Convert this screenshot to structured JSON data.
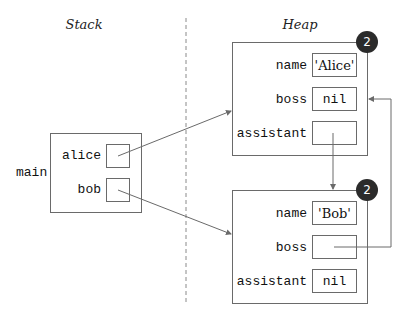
{
  "labels": {
    "stack": "Stack",
    "heap": "Heap"
  },
  "stack": {
    "frame_name": "main",
    "variables": [
      {
        "name": "alice",
        "points_to": "heap.objects.0"
      },
      {
        "name": "bob",
        "points_to": "heap.objects.1"
      }
    ]
  },
  "heap": {
    "objects": [
      {
        "refcount": "2",
        "fields": [
          {
            "name": "name",
            "value": "'Alice'"
          },
          {
            "name": "boss",
            "value": "nil"
          },
          {
            "name": "assistant",
            "value": "",
            "points_to": "heap.objects.1"
          }
        ]
      },
      {
        "refcount": "2",
        "fields": [
          {
            "name": "name",
            "value": "'Bob'"
          },
          {
            "name": "boss",
            "value": "",
            "points_to": "heap.objects.0"
          },
          {
            "name": "assistant",
            "value": "nil"
          }
        ]
      }
    ]
  },
  "colors": {
    "line": "#6a6a6a",
    "badge": "#2b2b2b",
    "divider": "#8a8a8a"
  }
}
